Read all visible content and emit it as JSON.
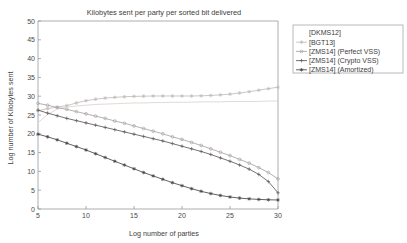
{
  "chart_data": {
    "type": "line",
    "title": "Kilobytes sent per party per sorted bit delivered",
    "xlabel": "Log number of parties",
    "ylabel": "Log number of Kilobytes sent",
    "xlim": [
      5,
      30
    ],
    "ylim": [
      0,
      50
    ],
    "xticks": [
      5,
      10,
      15,
      20,
      25,
      30
    ],
    "yticks": [
      0,
      5,
      10,
      15,
      20,
      25,
      30,
      35,
      40,
      45,
      50
    ],
    "xtick_labels": [
      "5",
      "10",
      "15",
      "20",
      "25",
      "30"
    ],
    "ytick_labels": [
      "0",
      "5",
      "10",
      "15",
      "20",
      "25",
      "30",
      "35",
      "40",
      "45",
      "50"
    ],
    "grid": false,
    "legend_position": "outside-upper-right",
    "x": [
      5,
      6,
      7,
      8,
      9,
      10,
      11,
      12,
      13,
      14,
      15,
      16,
      17,
      18,
      19,
      20,
      21,
      22,
      23,
      24,
      25,
      26,
      27,
      28,
      29,
      30
    ],
    "series": [
      {
        "name": "[DKMS12]",
        "color": "#d9d4cf",
        "marker": "none",
        "values": [
          23.0,
          25.1,
          26.6,
          27.1,
          27.4,
          27.6,
          27.8,
          27.9,
          28.0,
          28.1,
          28.2,
          28.2,
          28.3,
          28.3,
          28.4,
          28.4,
          28.4,
          28.5,
          28.5,
          28.5,
          28.6,
          28.6,
          28.6,
          28.6,
          28.7,
          28.7
        ]
      },
      {
        "name": "[BGT13]",
        "color": "#c3bcbc",
        "marker": "star",
        "values": [
          26.1,
          26.7,
          27.1,
          27.5,
          28.2,
          28.8,
          29.2,
          29.5,
          29.7,
          29.85,
          29.95,
          30.0,
          30.05,
          30.05,
          30.05,
          30.05,
          30.05,
          30.1,
          30.2,
          30.35,
          30.55,
          30.85,
          31.2,
          31.6,
          32.0,
          32.4
        ]
      },
      {
        "name": "[ZMS14] (Perfect VSS)",
        "color": "#a8a3a3",
        "marker": "circle",
        "values": [
          28.1,
          27.6,
          27.0,
          26.5,
          25.9,
          25.3,
          24.7,
          24.1,
          23.4,
          22.8,
          22.1,
          21.4,
          20.7,
          20.0,
          19.2,
          18.5,
          17.7,
          16.9,
          16.0,
          15.1,
          14.2,
          13.2,
          12.2,
          11.0,
          9.7,
          8.0
        ]
      },
      {
        "name": "[ZMS14] (Crypto VSS)",
        "color": "#5f5a5a",
        "marker": "plus",
        "values": [
          26.3,
          25.5,
          24.8,
          24.1,
          23.5,
          22.9,
          22.3,
          21.7,
          21.1,
          20.5,
          19.9,
          19.3,
          18.7,
          18.1,
          17.4,
          16.7,
          16.0,
          15.3,
          14.5,
          13.6,
          12.7,
          11.7,
          10.6,
          9.2,
          7.3,
          4.3
        ]
      },
      {
        "name": "[ZMS14] (Amortized)",
        "color": "#4a4545",
        "marker": "asterisk",
        "values": [
          19.9,
          19.2,
          18.4,
          17.5,
          16.6,
          15.7,
          14.7,
          13.7,
          12.7,
          11.7,
          10.7,
          9.7,
          8.8,
          7.9,
          7.0,
          6.2,
          5.4,
          4.7,
          4.1,
          3.6,
          3.2,
          2.9,
          2.7,
          2.55,
          2.45,
          2.4
        ]
      }
    ]
  },
  "figure": {
    "background_color": "#ffffff",
    "axis_color": "#9a9a9a",
    "text_color": "#3d3d3d"
  }
}
